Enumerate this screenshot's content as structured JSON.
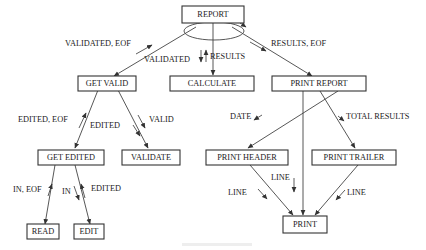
{
  "diagram": {
    "type": "structure-chart",
    "nodes": [
      {
        "id": "report",
        "label": "REPORT"
      },
      {
        "id": "get_valid",
        "label": "GET VALID"
      },
      {
        "id": "calculate",
        "label": "CALCULATE"
      },
      {
        "id": "print_report",
        "label": "PRINT REPORT"
      },
      {
        "id": "get_edited",
        "label": "GET EDITED"
      },
      {
        "id": "validate",
        "label": "VALIDATE"
      },
      {
        "id": "read",
        "label": "READ"
      },
      {
        "id": "edit",
        "label": "EDIT"
      },
      {
        "id": "print_header",
        "label": "PRINT HEADER"
      },
      {
        "id": "print_trailer",
        "label": "PRINT TRAILER"
      },
      {
        "id": "print",
        "label": "PRINT"
      }
    ],
    "edges": [
      {
        "from": "report",
        "to": "get_valid"
      },
      {
        "from": "report",
        "to": "calculate"
      },
      {
        "from": "report",
        "to": "print_report"
      },
      {
        "from": "get_valid",
        "to": "get_edited"
      },
      {
        "from": "get_valid",
        "to": "validate"
      },
      {
        "from": "get_edited",
        "to": "read"
      },
      {
        "from": "get_edited",
        "to": "edit"
      },
      {
        "from": "print_report",
        "to": "print_header"
      },
      {
        "from": "print_report",
        "to": "print"
      },
      {
        "from": "print_report",
        "to": "print_trailer"
      },
      {
        "from": "print_header",
        "to": "print"
      },
      {
        "from": "print_trailer",
        "to": "print"
      }
    ],
    "flow_labels": {
      "validated_eof": "VALIDATED, EOF",
      "validated": "VALIDATED",
      "results": "RESULTS",
      "results_eof": "RESULTS, EOF",
      "edited_eof": "EDITED, EOF",
      "edited": "EDITED",
      "valid": "VALID",
      "in_eof": "IN, EOF",
      "in": "IN",
      "edited2": "EDITED",
      "date": "DATE",
      "total_results": "TOTAL RESULTS",
      "line_header_out": "LINE",
      "line_header_in": "LINE",
      "line_direct": "LINE",
      "line_trailer": "LINE"
    }
  }
}
